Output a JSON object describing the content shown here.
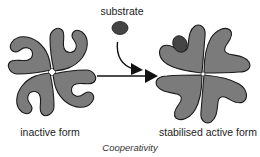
{
  "figure": {
    "title": "Cooperativity",
    "labels": {
      "substrate": "substrate",
      "inactive": "inactive form",
      "active": "stabilised active form"
    },
    "colors": {
      "subunit_fill": "#7b7b7b",
      "subunit_stroke": "#1a1a1a",
      "substrate_fill": "#454545",
      "arrow": "#111111",
      "background": "#ffffff"
    },
    "nodes": [
      {
        "id": "inactive-form",
        "label": "inactive form",
        "subunits": 4
      },
      {
        "id": "substrate",
        "label": "substrate"
      },
      {
        "id": "active-form",
        "label": "stabilised active form",
        "subunits": 4,
        "bound_substrates": 1
      }
    ],
    "edges": [
      {
        "from": "substrate",
        "to": "active-form",
        "style": "curved-arrow"
      },
      {
        "from": "inactive-form",
        "to": "active-form",
        "style": "straight-arrow"
      }
    ]
  }
}
